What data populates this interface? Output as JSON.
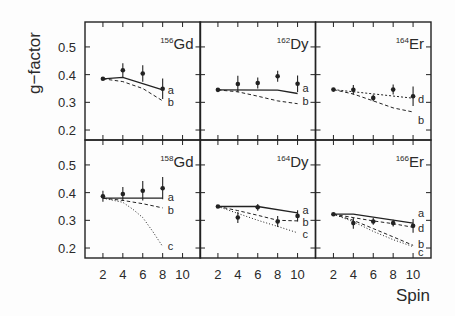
{
  "chart_data": {
    "type": "scatter",
    "title": "",
    "xlabel": "Spin",
    "ylabel": "g−factor",
    "xticks": [
      2,
      4,
      6,
      8,
      10
    ],
    "xtick_labels": [
      "2",
      "4",
      "6",
      "8",
      "10"
    ],
    "yticks": [
      0.2,
      0.3,
      0.4,
      0.5
    ],
    "ytick_labels": [
      "0.2",
      "0.3",
      "0.4",
      "0.5"
    ],
    "xlim": [
      0.2,
      11.8
    ],
    "ylim": [
      0.164,
      0.59
    ],
    "grid": false,
    "layout": {
      "rows": 2,
      "cols": 3,
      "shared_x": true,
      "shared_y": true
    },
    "colors": {
      "line": "#222222",
      "background": "#fdfdfd"
    },
    "panels": [
      {
        "id": "gd156",
        "row": 0,
        "col": 0,
        "mass": "156",
        "element": "Gd",
        "points": [
          {
            "spin": 2,
            "g": 0.385,
            "err": 0
          },
          {
            "spin": 4,
            "g": 0.416,
            "err": 0.025
          },
          {
            "spin": 6,
            "g": 0.404,
            "err": 0.03
          },
          {
            "spin": 8,
            "g": 0.349,
            "err": 0.037
          }
        ],
        "curves": [
          {
            "label": "a",
            "style": "solid",
            "label_g": 0.345,
            "points": [
              [
                2,
                0.385
              ],
              [
                4,
                0.39
              ],
              [
                8,
                0.345
              ]
            ]
          },
          {
            "label": "b",
            "style": "dashed",
            "label_g": 0.301,
            "points": [
              [
                2,
                0.385
              ],
              [
                4,
                0.375
              ],
              [
                6,
                0.35
              ],
              [
                8,
                0.305
              ]
            ]
          }
        ]
      },
      {
        "id": "dy162",
        "row": 0,
        "col": 1,
        "mass": "162",
        "element": "Dy",
        "points": [
          {
            "spin": 2,
            "g": 0.345,
            "err": 0
          },
          {
            "spin": 4,
            "g": 0.366,
            "err": 0.03
          },
          {
            "spin": 6,
            "g": 0.37,
            "err": 0.02
          },
          {
            "spin": 8,
            "g": 0.394,
            "err": 0.02
          },
          {
            "spin": 10,
            "g": 0.367,
            "err": 0.03
          }
        ],
        "curves": [
          {
            "label": "a",
            "style": "solid",
            "label_g": 0.352,
            "points": [
              [
                2,
                0.345
              ],
              [
                8,
                0.344
              ],
              [
                10,
                0.332
              ]
            ]
          },
          {
            "label": "b",
            "style": "dashed",
            "label_g": 0.305,
            "points": [
              [
                2,
                0.345
              ],
              [
                4,
                0.338
              ],
              [
                6,
                0.322
              ],
              [
                8,
                0.305
              ],
              [
                10,
                0.295
              ]
            ]
          }
        ]
      },
      {
        "id": "er164",
        "row": 0,
        "col": 2,
        "mass": "164",
        "element": "Er",
        "points": [
          {
            "spin": 2,
            "g": 0.346,
            "err": 0
          },
          {
            "spin": 4,
            "g": 0.345,
            "err": 0.018
          },
          {
            "spin": 6,
            "g": 0.316,
            "err": 0.012
          },
          {
            "spin": 8,
            "g": 0.346,
            "err": 0.018
          },
          {
            "spin": 10,
            "g": 0.322,
            "err": 0.035
          }
        ],
        "curves": [
          {
            "label": "d",
            "style": "dashdot",
            "label_g": 0.312,
            "points": [
              [
                2,
                0.346
              ],
              [
                10,
                0.315
              ]
            ]
          },
          {
            "label": "b",
            "style": "dashed",
            "label_g": 0.236,
            "points": [
              [
                2,
                0.346
              ],
              [
                4,
                0.33
              ],
              [
                6,
                0.305
              ],
              [
                8,
                0.28
              ],
              [
                10,
                0.265
              ]
            ]
          }
        ]
      },
      {
        "id": "gd158",
        "row": 1,
        "col": 0,
        "mass": "158",
        "element": "Gd",
        "points": [
          {
            "spin": 2,
            "g": 0.387,
            "err": 0.02
          },
          {
            "spin": 4,
            "g": 0.395,
            "err": 0.025
          },
          {
            "spin": 6,
            "g": 0.407,
            "err": 0.035
          },
          {
            "spin": 8,
            "g": 0.416,
            "err": 0.04
          }
        ],
        "curves": [
          {
            "label": "a",
            "style": "solid",
            "label_g": 0.384,
            "points": [
              [
                2,
                0.38
              ],
              [
                8,
                0.38
              ]
            ]
          },
          {
            "label": "b",
            "style": "dashed",
            "label_g": 0.337,
            "points": [
              [
                2,
                0.38
              ],
              [
                4,
                0.372
              ],
              [
                6,
                0.36
              ],
              [
                8,
                0.345
              ]
            ]
          },
          {
            "label": "c",
            "style": "dotted",
            "label_g": 0.207,
            "points": [
              [
                2,
                0.38
              ],
              [
                4,
                0.365
              ],
              [
                5,
                0.34
              ],
              [
                6,
                0.31
              ],
              [
                7,
                0.26
              ],
              [
                8,
                0.205
              ]
            ]
          }
        ]
      },
      {
        "id": "dy164",
        "row": 1,
        "col": 1,
        "mass": "164",
        "element": "Dy",
        "points": [
          {
            "spin": 2,
            "g": 0.35,
            "err": 0
          },
          {
            "spin": 4,
            "g": 0.31,
            "err": 0.02
          },
          {
            "spin": 6,
            "g": 0.347,
            "err": 0.012
          },
          {
            "spin": 8,
            "g": 0.296,
            "err": 0.02
          },
          {
            "spin": 10,
            "g": 0.316,
            "err": 0.02
          }
        ],
        "curves": [
          {
            "label": "a",
            "style": "solid",
            "label_g": 0.337,
            "points": [
              [
                2,
                0.35
              ],
              [
                6,
                0.35
              ],
              [
                10,
                0.327
              ]
            ]
          },
          {
            "label": "b",
            "style": "dashed",
            "label_g": 0.294,
            "points": [
              [
                2,
                0.35
              ],
              [
                4,
                0.335
              ],
              [
                6,
                0.318
              ],
              [
                8,
                0.3
              ],
              [
                10,
                0.298
              ]
            ]
          },
          {
            "label": "c",
            "style": "dotted",
            "label_g": 0.25,
            "points": [
              [
                2,
                0.35
              ],
              [
                4,
                0.325
              ],
              [
                6,
                0.3
              ],
              [
                8,
                0.278
              ],
              [
                10,
                0.255
              ]
            ]
          }
        ]
      },
      {
        "id": "er166",
        "row": 1,
        "col": 2,
        "mass": "166",
        "element": "Er",
        "points": [
          {
            "spin": 2,
            "g": 0.322,
            "err": 0
          },
          {
            "spin": 4,
            "g": 0.29,
            "err": 0.02
          },
          {
            "spin": 6,
            "g": 0.296,
            "err": 0.012
          },
          {
            "spin": 8,
            "g": 0.29,
            "err": 0.012
          },
          {
            "spin": 10,
            "g": 0.28,
            "err": 0.025
          }
        ],
        "curves": [
          {
            "label": "a",
            "style": "solid",
            "label_g": 0.326,
            "points": [
              [
                2,
                0.322
              ],
              [
                4,
                0.322
              ],
              [
                10,
                0.29
              ]
            ]
          },
          {
            "label": "d",
            "style": "dashed",
            "label_g": 0.272,
            "points": [
              [
                2,
                0.322
              ],
              [
                4,
                0.31
              ],
              [
                6,
                0.298
              ],
              [
                8,
                0.288
              ],
              [
                10,
                0.275
              ]
            ]
          },
          {
            "label": "b",
            "style": "dashed",
            "label_g": 0.215,
            "points": [
              [
                2,
                0.322
              ],
              [
                4,
                0.3
              ],
              [
                6,
                0.27
              ],
              [
                8,
                0.24
              ],
              [
                10,
                0.21
              ]
            ]
          },
          {
            "label": "c",
            "style": "dotted",
            "label_g": 0.186,
            "points": [
              [
                2,
                0.322
              ],
              [
                4,
                0.295
              ],
              [
                6,
                0.26
              ],
              [
                8,
                0.23
              ],
              [
                10,
                0.205
              ]
            ]
          }
        ]
      }
    ]
  }
}
